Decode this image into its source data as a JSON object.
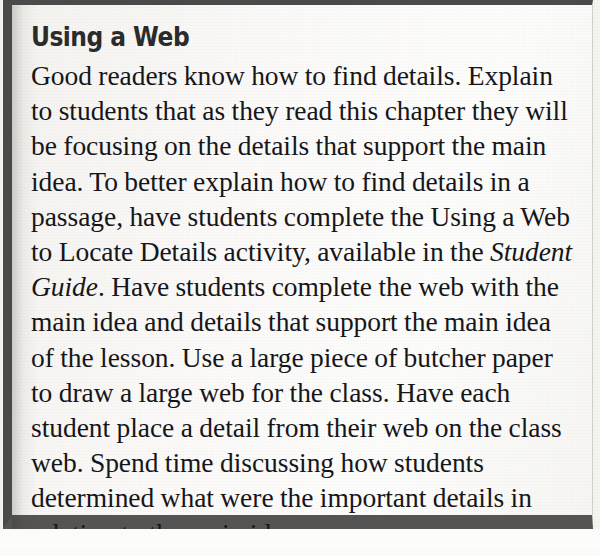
{
  "document": {
    "type": "scanned-textbook-callout",
    "colors": {
      "border": "#4a4a4a",
      "border_bottom": "#555452",
      "paper": "#f6f5f2",
      "callout_paper": "#fbfaf8",
      "heading_text": "#2b2b2b",
      "body_text": "#16161a"
    }
  },
  "callout": {
    "title": "Using a Web",
    "body": {
      "part1": "Good readers know how to find details. Explain to students that as they read this chapter they will be focusing on the details that support the main idea. To better explain how to find details in a passage, have students complete the Using a Web to Locate Details activity, available in the ",
      "emphasis": "Student Guide",
      "part2": ". Have students complete the web with the main idea and details that support the main idea of the lesson. Use a large piece of butcher paper to draw a large web for the class. Have each student place a detail from their web on the class web. Spend time discussing how students determined what were the important details in relation to the main idea."
    }
  }
}
